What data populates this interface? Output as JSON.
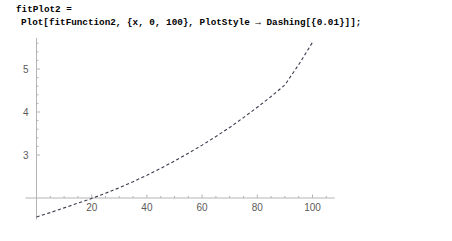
{
  "notebook": {
    "input_cell": {
      "line1": "fitPlot2 =",
      "line2": "Plot[fitFunction2, {x, 0, 100}, PlotStyle → Dashing[{0.01}]];"
    }
  },
  "colors": {
    "background": "#ffffff",
    "code_text": "#000000",
    "axis": "#b4b4b4",
    "tick_label": "#5a5a5a",
    "curve": "#3b3b4d"
  },
  "chart_data": {
    "type": "line",
    "title": "",
    "xlabel": "",
    "ylabel": "",
    "grid": false,
    "legend": "none",
    "line_style": "dashed",
    "dash_spec": "Dashing[{0.01}]",
    "xlim": [
      0,
      100
    ],
    "ylim": [
      1.5,
      5.7
    ],
    "x_axis_crossing_y": 2,
    "y_axis_crossing_x": 0,
    "xticks": [
      20,
      40,
      60,
      80,
      100
    ],
    "xtick_labels": [
      "20",
      "40",
      "60",
      "80",
      "100"
    ],
    "yticks": [
      3,
      4,
      5
    ],
    "ytick_labels": [
      "3",
      "4",
      "5"
    ],
    "x_minor_tick_step": 5,
    "y_minor_tick_step": 0.2,
    "series": [
      {
        "name": "fitFunction2",
        "x": [
          0,
          5,
          10,
          15,
          20,
          25,
          30,
          35,
          40,
          45,
          50,
          55,
          60,
          65,
          70,
          75,
          80,
          85,
          90,
          95,
          100
        ],
        "y": [
          1.56,
          1.66,
          1.77,
          1.88,
          1.99,
          2.11,
          2.24,
          2.38,
          2.53,
          2.69,
          2.86,
          3.04,
          3.23,
          3.43,
          3.64,
          3.87,
          4.11,
          4.36,
          4.63,
          5.1,
          5.62
        ]
      }
    ]
  }
}
